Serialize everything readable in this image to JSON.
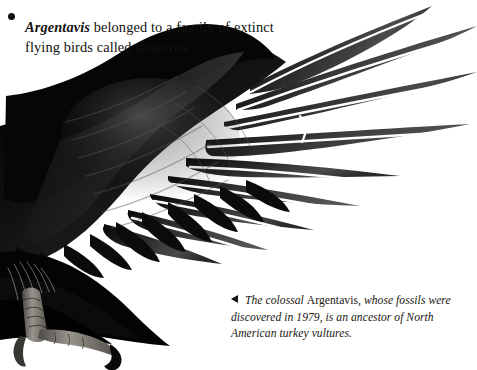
{
  "page": {
    "background_color": "#ffffff",
    "width": 477,
    "height": 370
  },
  "bullet_note": {
    "marker_icon": "bullet-dot-icon",
    "species_name": "Argentavis",
    "text_rest": " belonged to a family of extinct flying birds called teratorns.",
    "full_text": "Argentavis belonged to a family of extinct flying birds called teratorns.",
    "text_color": "#14120f"
  },
  "caption": {
    "marker_icon": "left-pointing-triangle-icon",
    "lead_italic": "The colossal ",
    "species_name": "Argentavis",
    "tail_italic": ", whose fossils were discovered in 1979, is an ancestor of North American turkey vultures.",
    "full_text": "The colossal Argentavis, whose fossils were discovered in 1979, is an ancestor of North American turkey vultures.",
    "year": "1979",
    "text_color": "#1a1714"
  },
  "figure": {
    "alt": "Black-and-white photograph of a large outstretched vulture wing with splayed primary flight feathers, the bird's scaly leg and hooked talon visible at lower left",
    "colors": {
      "feather_black": "#050505",
      "feather_dark": "#1b1b1b",
      "feather_mid": "#3a3a3a",
      "feather_light": "#6e6e6e",
      "highlight": "#cfcfcf",
      "leg_gray": "#8d8a85",
      "background": "#ffffff"
    }
  }
}
